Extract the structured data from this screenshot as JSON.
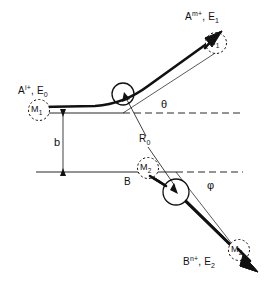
{
  "figure": {
    "type": "collision-trajectory-diagram",
    "background_color": "#ffffff",
    "stroke_color": "#111111"
  },
  "labels": {
    "incoming_projectile": {
      "species_main": "A",
      "species_sup": "i+",
      "energy_main": ", E",
      "energy_sub": "0",
      "full_text": "A i+ , E 0"
    },
    "outgoing_projectile": {
      "species_main": "A",
      "species_sup": "m+",
      "energy_main": ", E",
      "energy_sub": "1",
      "full_text": "A m+ , E 1"
    },
    "outgoing_target": {
      "species_main": "B",
      "species_sup": "n+",
      "energy_main": ", E",
      "energy_sub": "2",
      "full_text": "B n+ , E 2"
    },
    "target_atom": "B",
    "mass_projectile_in": {
      "main": "M",
      "sub": "1"
    },
    "mass_projectile_out": {
      "main": "M",
      "sub": "1"
    },
    "mass_target_in": {
      "main": "M",
      "sub": "2"
    },
    "mass_target_out": {
      "main": "M",
      "sub": "2"
    },
    "angle_upper": "θ",
    "angle_lower": "φ",
    "impact_parameter": "b",
    "closest_approach": {
      "main": "R",
      "sub": "0"
    }
  },
  "geometry": {
    "upper_axis_y": 113,
    "lower_axis_y": 172,
    "upper_collision_center": {
      "x": 123,
      "y": 94,
      "r": 11
    },
    "lower_collision_center": {
      "x": 176,
      "y": 192,
      "r": 13
    },
    "impact_parameter_x": 63,
    "theta_deg": 33,
    "phi_deg": 40
  }
}
